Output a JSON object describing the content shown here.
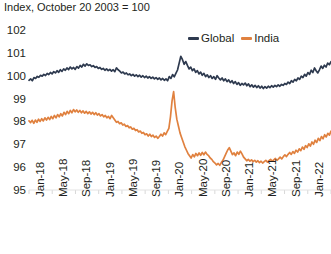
{
  "chart_data": {
    "type": "line",
    "title": "Index, October 20 2003 = 100",
    "xlabel": "",
    "ylabel": "",
    "ylim": [
      95,
      102
    ],
    "yticks": [
      95,
      96,
      97,
      98,
      99,
      100,
      101,
      102
    ],
    "grid": false,
    "legend_position": "top-right",
    "x_tick_labels": [
      "Jan-18",
      "May-18",
      "Sep-18",
      "Jan-19",
      "May-19",
      "Sep-19",
      "Jan-20",
      "May-20",
      "Sep-20",
      "Jan-21",
      "May-21",
      "Sep-21",
      "Jan-22",
      "May-22"
    ],
    "x_tick_interval_months": 4,
    "x_start": "Jan-18",
    "x_end": "Jun-22",
    "colors": {
      "global": "#2e3a4f",
      "india": "#e0813f"
    },
    "series": [
      {
        "name": "Global",
        "color": "#2e3a4f",
        "values": [
          99.8,
          99.86,
          99.78,
          99.92,
          99.88,
          99.97,
          99.93,
          100.02,
          99.98,
          100.06,
          100.01,
          100.1,
          100.05,
          100.14,
          100.08,
          100.18,
          100.12,
          100.22,
          100.15,
          100.26,
          100.19,
          100.3,
          100.24,
          100.34,
          100.27,
          100.38,
          100.3,
          100.36,
          100.28,
          100.4,
          100.33,
          100.45,
          100.38,
          100.5,
          100.42,
          100.52,
          100.45,
          100.48,
          100.4,
          100.44,
          100.36,
          100.4,
          100.32,
          100.36,
          100.28,
          100.32,
          100.24,
          100.3,
          100.22,
          100.28,
          100.2,
          100.26,
          100.18,
          100.34,
          100.26,
          100.2,
          100.12,
          100.16,
          100.08,
          100.12,
          100.04,
          100.08,
          100.0,
          100.06,
          99.98,
          100.04,
          99.96,
          100.02,
          99.94,
          100.0,
          99.92,
          99.98,
          99.9,
          99.96,
          99.88,
          99.94,
          99.86,
          99.92,
          99.84,
          99.9,
          99.82,
          99.88,
          99.8,
          99.86,
          99.78,
          99.96,
          99.88,
          100.05,
          99.95,
          100.1,
          100.25,
          100.55,
          100.85,
          100.7,
          100.5,
          100.62,
          100.45,
          100.3,
          100.38,
          100.22,
          100.3,
          100.15,
          100.22,
          100.08,
          100.16,
          100.02,
          100.1,
          99.96,
          100.04,
          99.92,
          100.0,
          99.88,
          99.96,
          99.84,
          100.0,
          99.9,
          99.82,
          99.9,
          99.78,
          99.86,
          99.74,
          99.82,
          99.7,
          99.78,
          99.66,
          99.74,
          99.62,
          99.7,
          99.58,
          99.66,
          99.6,
          99.68,
          99.56,
          99.64,
          99.52,
          99.6,
          99.5,
          99.58,
          99.48,
          99.56,
          99.46,
          99.54,
          99.44,
          99.52,
          99.46,
          99.54,
          99.48,
          99.56,
          99.5,
          99.58,
          99.52,
          99.6,
          99.54,
          99.62,
          99.58,
          99.66,
          99.62,
          99.72,
          99.66,
          99.78,
          99.72,
          99.84,
          99.78,
          99.9,
          99.84,
          99.98,
          99.92,
          100.06,
          99.98,
          100.14,
          100.06,
          100.24,
          100.14,
          100.34,
          100.22,
          100.12,
          100.26,
          100.42,
          100.32,
          100.46,
          100.38,
          100.55,
          100.48,
          100.62
        ]
      },
      {
        "name": "India",
        "color": "#e0813f",
        "values": [
          98.02,
          97.95,
          98.05,
          97.92,
          98.06,
          97.96,
          98.1,
          98.0,
          98.12,
          98.02,
          98.16,
          98.06,
          98.18,
          98.08,
          98.22,
          98.12,
          98.26,
          98.16,
          98.3,
          98.2,
          98.34,
          98.24,
          98.4,
          98.3,
          98.44,
          98.34,
          98.48,
          98.38,
          98.52,
          98.42,
          98.5,
          98.4,
          98.48,
          98.38,
          98.46,
          98.36,
          98.44,
          98.34,
          98.42,
          98.32,
          98.4,
          98.3,
          98.38,
          98.28,
          98.34,
          98.24,
          98.3,
          98.2,
          98.26,
          98.16,
          98.22,
          98.12,
          98.26,
          98.16,
          98.06,
          97.96,
          98.0,
          97.9,
          97.94,
          97.84,
          97.88,
          97.78,
          97.82,
          97.72,
          97.76,
          97.66,
          97.7,
          97.6,
          97.64,
          97.54,
          97.58,
          97.48,
          97.52,
          97.42,
          97.46,
          97.36,
          97.44,
          97.34,
          97.4,
          97.3,
          97.36,
          97.26,
          97.34,
          97.44,
          97.36,
          97.5,
          97.42,
          97.56,
          97.7,
          98.2,
          98.9,
          99.3,
          98.6,
          98.1,
          97.8,
          97.5,
          97.3,
          97.1,
          96.9,
          96.75,
          96.6,
          96.5,
          96.4,
          96.55,
          96.45,
          96.6,
          96.5,
          96.62,
          96.52,
          96.64,
          96.54,
          96.66,
          96.56,
          96.5,
          96.4,
          96.34,
          96.24,
          96.18,
          96.1,
          96.16,
          96.08,
          96.2,
          96.3,
          96.45,
          96.6,
          96.75,
          96.85,
          96.7,
          96.55,
          96.62,
          96.5,
          96.66,
          96.56,
          96.7,
          96.58,
          96.44,
          96.36,
          96.28,
          96.34,
          96.26,
          96.32,
          96.24,
          96.3,
          96.22,
          96.28,
          96.2,
          96.26,
          96.18,
          96.24,
          96.3,
          96.22,
          96.28,
          96.34,
          96.26,
          96.32,
          96.38,
          96.3,
          96.36,
          96.44,
          96.36,
          96.46,
          96.54,
          96.46,
          96.56,
          96.64,
          96.56,
          96.68,
          96.6,
          96.74,
          96.66,
          96.8,
          96.72,
          96.88,
          96.78,
          96.94,
          96.86,
          97.02,
          96.92,
          97.1,
          97.0,
          97.18,
          97.08,
          97.26,
          97.16,
          97.34,
          97.24,
          97.42,
          97.32,
          97.48,
          97.4,
          97.58
        ]
      }
    ]
  }
}
